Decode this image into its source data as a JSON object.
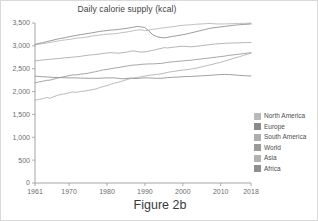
{
  "figure": {
    "caption": "Figure 2b"
  },
  "chart_data": {
    "type": "line",
    "title": "Daily calorie supply (kcal)",
    "xlabel": "",
    "ylabel": "",
    "xlim": [
      1961,
      2018
    ],
    "ylim": [
      0,
      3500
    ],
    "grid": false,
    "legend_position": "right",
    "x_ticks": [
      "1961",
      "1970",
      "1980",
      "1990",
      "2000",
      "2010",
      "2018"
    ],
    "x_tick_values": [
      1961,
      1970,
      1980,
      1990,
      2000,
      2010,
      2018
    ],
    "y_ticks": [
      "0",
      "500",
      "1,000",
      "1,500",
      "2,000",
      "2,500",
      "3,000",
      "3,500"
    ],
    "y_tick_values": [
      0,
      500,
      1000,
      1500,
      2000,
      2500,
      3000,
      3500
    ],
    "x": [
      1961,
      1962,
      1963,
      1964,
      1965,
      1966,
      1967,
      1968,
      1969,
      1970,
      1971,
      1972,
      1973,
      1974,
      1975,
      1976,
      1977,
      1978,
      1979,
      1980,
      1981,
      1982,
      1983,
      1984,
      1985,
      1986,
      1987,
      1988,
      1989,
      1990,
      1991,
      1992,
      1993,
      1994,
      1995,
      1996,
      1997,
      1998,
      1999,
      2000,
      2001,
      2002,
      2003,
      2004,
      2005,
      2006,
      2007,
      2008,
      2009,
      2010,
      2011,
      2012,
      2013,
      2014,
      2015,
      2016,
      2017,
      2018
    ],
    "series": [
      {
        "name": "North America",
        "color": "#b4b4b4",
        "values": [
          3020,
          3035,
          3050,
          3060,
          3075,
          3090,
          3105,
          3120,
          3130,
          3140,
          3155,
          3170,
          3175,
          3185,
          3195,
          3215,
          3225,
          3235,
          3245,
          3255,
          3260,
          3265,
          3275,
          3290,
          3300,
          3315,
          3330,
          3345,
          3355,
          3330,
          3345,
          3360,
          3370,
          3385,
          3395,
          3405,
          3415,
          3425,
          3440,
          3450,
          3455,
          3460,
          3470,
          3475,
          3480,
          3485,
          3490,
          3485,
          3480,
          3478,
          3480,
          3482,
          3485,
          3488,
          3490,
          3492,
          3495,
          3498
        ]
      },
      {
        "name": "Europe",
        "color": "#8a8a8a",
        "values": [
          3030,
          3055,
          3070,
          3090,
          3110,
          3130,
          3150,
          3165,
          3180,
          3200,
          3215,
          3230,
          3245,
          3260,
          3270,
          3285,
          3300,
          3315,
          3325,
          3335,
          3345,
          3350,
          3360,
          3370,
          3380,
          3395,
          3410,
          3425,
          3415,
          3400,
          3330,
          3250,
          3205,
          3185,
          3175,
          3185,
          3205,
          3215,
          3230,
          3245,
          3260,
          3280,
          3300,
          3320,
          3340,
          3360,
          3380,
          3395,
          3405,
          3415,
          3425,
          3435,
          3445,
          3455,
          3462,
          3468,
          3474,
          3480
        ]
      },
      {
        "name": "South America",
        "color": "#a8a8a8",
        "values": [
          2670,
          2680,
          2690,
          2700,
          2705,
          2715,
          2720,
          2730,
          2740,
          2745,
          2755,
          2760,
          2770,
          2785,
          2795,
          2805,
          2810,
          2820,
          2835,
          2845,
          2850,
          2845,
          2840,
          2850,
          2860,
          2880,
          2890,
          2875,
          2865,
          2870,
          2885,
          2900,
          2920,
          2940,
          2960,
          2955,
          2965,
          2975,
          2985,
          2990,
          2985,
          2980,
          2985,
          2995,
          3005,
          3015,
          3025,
          3035,
          3045,
          3050,
          3055,
          3060,
          3062,
          3065,
          3068,
          3070,
          3072,
          3075
        ]
      },
      {
        "name": "World",
        "color": "#969696",
        "values": [
          2190,
          2210,
          2225,
          2245,
          2250,
          2275,
          2295,
          2315,
          2330,
          2350,
          2365,
          2365,
          2380,
          2390,
          2400,
          2420,
          2435,
          2455,
          2475,
          2485,
          2500,
          2515,
          2525,
          2540,
          2555,
          2570,
          2580,
          2585,
          2595,
          2600,
          2605,
          2605,
          2610,
          2615,
          2625,
          2640,
          2650,
          2655,
          2665,
          2670,
          2680,
          2685,
          2695,
          2705,
          2715,
          2725,
          2735,
          2745,
          2755,
          2765,
          2775,
          2790,
          2800,
          2810,
          2820,
          2830,
          2840,
          2850
        ]
      },
      {
        "name": "Asia",
        "color": "#aeaeae",
        "values": [
          1810,
          1830,
          1845,
          1870,
          1855,
          1890,
          1920,
          1940,
          1950,
          1975,
          1990,
          1985,
          2000,
          2010,
          2025,
          2040,
          2055,
          2085,
          2110,
          2130,
          2160,
          2185,
          2205,
          2230,
          2255,
          2280,
          2295,
          2310,
          2325,
          2340,
          2355,
          2365,
          2375,
          2385,
          2400,
          2420,
          2435,
          2445,
          2460,
          2470,
          2480,
          2490,
          2505,
          2520,
          2540,
          2560,
          2580,
          2600,
          2620,
          2640,
          2665,
          2690,
          2715,
          2740,
          2765,
          2790,
          2815,
          2840
        ]
      },
      {
        "name": "Africa",
        "color": "#8f8f8f",
        "values": [
          2340,
          2330,
          2325,
          2320,
          2315,
          2310,
          2308,
          2305,
          2302,
          2300,
          2300,
          2298,
          2295,
          2293,
          2292,
          2290,
          2290,
          2292,
          2295,
          2300,
          2300,
          2298,
          2290,
          2280,
          2285,
          2295,
          2290,
          2285,
          2295,
          2300,
          2300,
          2295,
          2290,
          2290,
          2295,
          2305,
          2310,
          2315,
          2320,
          2325,
          2330,
          2330,
          2335,
          2340,
          2345,
          2350,
          2355,
          2360,
          2368,
          2372,
          2375,
          2372,
          2368,
          2362,
          2355,
          2350,
          2345,
          2340
        ]
      }
    ]
  },
  "legend": {
    "items": [
      {
        "label": "North America",
        "color": "#b9b9b9"
      },
      {
        "label": "Europe",
        "color": "#8a8a8a"
      },
      {
        "label": "South America",
        "color": "#aeaeae"
      },
      {
        "label": "World",
        "color": "#9a9a9a"
      },
      {
        "label": "Asia",
        "color": "#b2b2b2"
      },
      {
        "label": "Africa",
        "color": "#8f8f8f"
      }
    ]
  }
}
